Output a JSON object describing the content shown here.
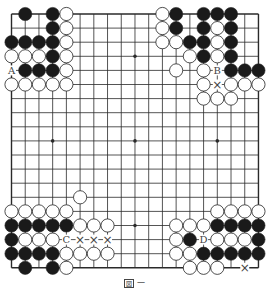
{
  "diagram": {
    "type": "go-board",
    "size": 19,
    "geometry": {
      "x0": 11.5,
      "y0": 14,
      "dx": 13.72,
      "dy": 14.1,
      "stone_r": 6.6
    },
    "colors": {
      "line": "#2a2a2a",
      "black_stone": "#1a1a1a",
      "white_stone": "#ffffff",
      "stone_edge": "#222222",
      "label": "#444444"
    },
    "star_points": [
      [
        3,
        3
      ],
      [
        9,
        3
      ],
      [
        15,
        3
      ],
      [
        3,
        9
      ],
      [
        9,
        9
      ],
      [
        15,
        9
      ],
      [
        3,
        15
      ],
      [
        9,
        15
      ],
      [
        15,
        15
      ]
    ],
    "stones": {
      "black": [
        [
          1,
          0
        ],
        [
          3,
          0
        ],
        [
          3,
          1
        ],
        [
          0,
          2
        ],
        [
          1,
          2
        ],
        [
          2,
          2
        ],
        [
          3,
          2
        ],
        [
          3,
          3
        ],
        [
          1,
          4
        ],
        [
          2,
          4
        ],
        [
          3,
          4
        ],
        [
          12,
          0
        ],
        [
          14,
          0
        ],
        [
          15,
          0
        ],
        [
          16,
          0
        ],
        [
          12,
          1
        ],
        [
          14,
          1
        ],
        [
          16,
          1
        ],
        [
          13,
          2
        ],
        [
          14,
          2
        ],
        [
          16,
          2
        ],
        [
          14,
          3
        ],
        [
          16,
          3
        ],
        [
          16,
          4
        ],
        [
          17,
          4
        ],
        [
          18,
          4
        ],
        [
          0,
          15
        ],
        [
          1,
          15
        ],
        [
          2,
          15
        ],
        [
          3,
          15
        ],
        [
          4,
          15
        ],
        [
          0,
          16
        ],
        [
          0,
          17
        ],
        [
          1,
          17
        ],
        [
          2,
          17
        ],
        [
          3,
          17
        ],
        [
          1,
          18
        ],
        [
          3,
          18
        ],
        [
          15,
          15
        ],
        [
          16,
          15
        ],
        [
          17,
          15
        ],
        [
          18,
          15
        ],
        [
          13,
          16
        ],
        [
          18,
          16
        ],
        [
          14,
          17
        ],
        [
          15,
          17
        ],
        [
          16,
          17
        ],
        [
          17,
          17
        ],
        [
          18,
          17
        ]
      ],
      "white": [
        [
          4,
          0
        ],
        [
          4,
          1
        ],
        [
          4,
          2
        ],
        [
          0,
          3
        ],
        [
          1,
          3
        ],
        [
          2,
          3
        ],
        [
          4,
          3
        ],
        [
          4,
          4
        ],
        [
          0,
          5
        ],
        [
          1,
          5
        ],
        [
          2,
          5
        ],
        [
          3,
          5
        ],
        [
          4,
          5
        ],
        [
          11,
          0
        ],
        [
          11,
          1
        ],
        [
          11,
          2
        ],
        [
          12,
          2
        ],
        [
          15,
          1
        ],
        [
          15,
          2
        ],
        [
          13,
          3
        ],
        [
          15,
          3
        ],
        [
          12,
          4
        ],
        [
          14,
          4
        ],
        [
          14,
          5
        ],
        [
          16,
          5
        ],
        [
          17,
          5
        ],
        [
          18,
          5
        ],
        [
          14,
          6
        ],
        [
          15,
          6
        ],
        [
          16,
          6
        ],
        [
          5,
          13
        ],
        [
          0,
          14
        ],
        [
          1,
          14
        ],
        [
          2,
          14
        ],
        [
          3,
          14
        ],
        [
          4,
          14
        ],
        [
          5,
          15
        ],
        [
          6,
          15
        ],
        [
          7,
          15
        ],
        [
          1,
          16
        ],
        [
          2,
          16
        ],
        [
          3,
          16
        ],
        [
          4,
          17
        ],
        [
          5,
          17
        ],
        [
          6,
          17
        ],
        [
          7,
          17
        ],
        [
          4,
          18
        ],
        [
          15,
          14
        ],
        [
          16,
          14
        ],
        [
          17,
          14
        ],
        [
          18,
          14
        ],
        [
          12,
          15
        ],
        [
          13,
          15
        ],
        [
          14,
          15
        ],
        [
          12,
          16
        ],
        [
          15,
          16
        ],
        [
          16,
          16
        ],
        [
          17,
          16
        ],
        [
          12,
          17
        ],
        [
          13,
          17
        ],
        [
          13,
          18
        ],
        [
          14,
          18
        ],
        [
          15,
          18
        ]
      ]
    },
    "labels": [
      {
        "text": "A",
        "col": 0,
        "row": 4
      },
      {
        "text": "B",
        "col": 15,
        "row": 4
      },
      {
        "text": "C",
        "col": 4,
        "row": 16
      },
      {
        "text": "D",
        "col": 14,
        "row": 16
      }
    ],
    "marks": [
      {
        "symbol": "×",
        "col": 15,
        "row": 5
      },
      {
        "symbol": "×",
        "col": 5,
        "row": 16
      },
      {
        "symbol": "×",
        "col": 6,
        "row": 16
      },
      {
        "symbol": "×",
        "col": 7,
        "row": 16
      },
      {
        "symbol": "×",
        "col": 17,
        "row": 18
      }
    ]
  },
  "caption": {
    "boxed": "図",
    "number": "一"
  }
}
